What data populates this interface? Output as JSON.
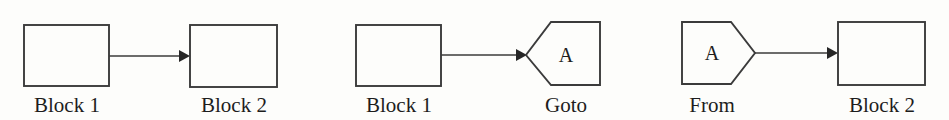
{
  "figure": {
    "width": 949,
    "height": 120,
    "background_color": "#fdfdfb",
    "line_color": "#3b3b3b",
    "text_color": "#1d1d1d"
  },
  "panels": [
    {
      "id": "panel-direct-connection",
      "source": {
        "label": "Block 1",
        "shape": "rectangle",
        "x": 24,
        "y": 25,
        "width": 85,
        "height": 61
      },
      "target": {
        "label": "Block 2",
        "shape": "rectangle",
        "x": 190,
        "y": 25,
        "width": 87,
        "height": 62
      },
      "connector": {
        "from_x": 109,
        "to_x": 190,
        "y": 56,
        "arrow": "filled-triangle"
      }
    },
    {
      "id": "panel-goto",
      "source": {
        "label": "Block 1",
        "shape": "rectangle",
        "x": 356,
        "y": 25,
        "width": 85,
        "height": 61
      },
      "target": {
        "label": "Goto",
        "tag": "A",
        "shape": "pentagon-point-left",
        "x": 526,
        "y": 22,
        "width": 74,
        "height": 63
      },
      "connector": {
        "from_x": 441,
        "to_x": 527,
        "y": 55,
        "arrow": "filled-triangle"
      }
    },
    {
      "id": "panel-from",
      "source": {
        "label": "From",
        "tag": "A",
        "shape": "pentagon-point-right",
        "x": 682,
        "y": 22,
        "width": 73,
        "height": 62
      },
      "target": {
        "label": "Block 2",
        "shape": "rectangle",
        "x": 838,
        "y": 22,
        "width": 87,
        "height": 63
      },
      "connector": {
        "from_x": 755,
        "to_x": 838,
        "y": 53,
        "arrow": "filled-triangle"
      }
    }
  ],
  "labels": {
    "block1_left": "Block 1",
    "block2_left": "Block 2",
    "block1_mid": "Block 1",
    "goto": "Goto",
    "from": "From",
    "block2_right": "Block 2",
    "tag_goto": "A",
    "tag_from": "A"
  }
}
